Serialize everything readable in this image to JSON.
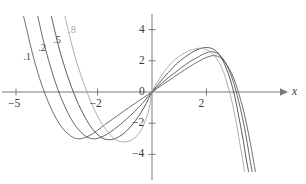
{
  "chart_data": {
    "type": "line",
    "title": "",
    "subtitle": "",
    "xlabel": "x",
    "ylabel": "",
    "xlim": [
      -5.7,
      5.7
    ],
    "ylim": [
      -5.0,
      4.8
    ],
    "grid": false,
    "legend_position": "inline-curve-labels",
    "x_ticks": [
      -5,
      -2,
      2
    ],
    "x_tick_labels": [
      "−5",
      "−2",
      "2"
    ],
    "y_ticks": [
      4,
      2,
      0,
      -2,
      -4
    ],
    "y_tick_labels": [
      "4",
      "2",
      "0",
      "−2",
      "−4"
    ],
    "annotations": [
      {
        "text": ".1",
        "x": -4.55,
        "y": 2.15,
        "color": "#4a4a4a"
      },
      {
        "text": ".2",
        "x": -4.0,
        "y": 2.75,
        "color": "#4a4a4a"
      },
      {
        "text": ".5",
        "x": -3.45,
        "y": 3.3,
        "color": "#4a4a4a"
      },
      {
        "text": ".8",
        "x": -2.9,
        "y": 3.9,
        "color": "#a8a8a8"
      }
    ],
    "series": [
      {
        "name": ".1",
        "color": "#555555",
        "points": [
          [
            -4.72,
            4.85
          ],
          [
            -4.55,
            3.6
          ],
          [
            -4.4,
            2.5
          ],
          [
            -4.2,
            1.25
          ],
          [
            -4.0,
            0.2
          ],
          [
            -3.8,
            -0.7
          ],
          [
            -3.6,
            -1.45
          ],
          [
            -3.4,
            -2.05
          ],
          [
            -3.2,
            -2.5
          ],
          [
            -3.0,
            -2.8
          ],
          [
            -2.85,
            -2.95
          ],
          [
            -2.7,
            -3.0
          ],
          [
            -2.55,
            -2.97
          ],
          [
            -2.4,
            -2.88
          ],
          [
            -2.2,
            -2.7
          ],
          [
            -2.0,
            -2.45
          ],
          [
            -1.7,
            -2.05
          ],
          [
            -1.4,
            -1.68
          ],
          [
            -1.0,
            -1.18
          ],
          [
            -0.6,
            -0.7
          ],
          [
            -0.3,
            -0.35
          ],
          [
            0,
            0
          ],
          [
            0.4,
            0.48
          ],
          [
            0.8,
            0.95
          ],
          [
            1.2,
            1.42
          ],
          [
            1.5,
            1.75
          ],
          [
            1.75,
            2.0
          ],
          [
            1.95,
            2.18
          ],
          [
            2.1,
            2.28
          ],
          [
            2.25,
            2.33
          ],
          [
            2.4,
            2.3
          ],
          [
            2.55,
            2.15
          ],
          [
            2.7,
            1.88
          ],
          [
            2.85,
            1.45
          ],
          [
            3.0,
            0.9
          ],
          [
            3.12,
            0.3
          ],
          [
            3.25,
            -0.45
          ],
          [
            3.38,
            -1.3
          ],
          [
            3.5,
            -2.25
          ],
          [
            3.62,
            -3.3
          ],
          [
            3.72,
            -4.3
          ],
          [
            3.8,
            -5.1
          ]
        ]
      },
      {
        "name": ".2",
        "color": "#4a4a4a",
        "points": [
          [
            -4.2,
            4.85
          ],
          [
            -4.05,
            3.7
          ],
          [
            -3.9,
            2.65
          ],
          [
            -3.72,
            1.55
          ],
          [
            -3.55,
            0.6
          ],
          [
            -3.38,
            -0.2
          ],
          [
            -3.2,
            -0.95
          ],
          [
            -3.0,
            -1.65
          ],
          [
            -2.8,
            -2.2
          ],
          [
            -2.6,
            -2.6
          ],
          [
            -2.45,
            -2.82
          ],
          [
            -2.3,
            -2.95
          ],
          [
            -2.15,
            -3.0
          ],
          [
            -2.0,
            -2.97
          ],
          [
            -1.85,
            -2.88
          ],
          [
            -1.65,
            -2.7
          ],
          [
            -1.4,
            -2.4
          ],
          [
            -1.1,
            -1.98
          ],
          [
            -0.8,
            -1.52
          ],
          [
            -0.5,
            -1.0
          ],
          [
            -0.25,
            -0.52
          ],
          [
            0,
            0
          ],
          [
            0.35,
            0.55
          ],
          [
            0.7,
            1.05
          ],
          [
            1.05,
            1.52
          ],
          [
            1.4,
            1.95
          ],
          [
            1.65,
            2.2
          ],
          [
            1.85,
            2.4
          ],
          [
            2.0,
            2.52
          ],
          [
            2.15,
            2.58
          ],
          [
            2.3,
            2.55
          ],
          [
            2.45,
            2.42
          ],
          [
            2.6,
            2.15
          ],
          [
            2.75,
            1.72
          ],
          [
            2.88,
            1.2
          ],
          [
            3.0,
            0.6
          ],
          [
            3.12,
            -0.15
          ],
          [
            3.25,
            -1.05
          ],
          [
            3.38,
            -2.1
          ],
          [
            3.5,
            -3.25
          ],
          [
            3.6,
            -4.3
          ],
          [
            3.68,
            -5.1
          ]
        ]
      },
      {
        "name": ".5",
        "color": "#3f3f3f",
        "points": [
          [
            -3.7,
            4.85
          ],
          [
            -3.55,
            3.75
          ],
          [
            -3.4,
            2.7
          ],
          [
            -3.22,
            1.65
          ],
          [
            -3.05,
            0.75
          ],
          [
            -2.88,
            -0.05
          ],
          [
            -2.7,
            -0.8
          ],
          [
            -2.5,
            -1.5
          ],
          [
            -2.3,
            -2.1
          ],
          [
            -2.1,
            -2.55
          ],
          [
            -1.95,
            -2.8
          ],
          [
            -1.8,
            -2.98
          ],
          [
            -1.65,
            -3.05
          ],
          [
            -1.5,
            -3.05
          ],
          [
            -1.35,
            -2.98
          ],
          [
            -1.2,
            -2.85
          ],
          [
            -1.0,
            -2.6
          ],
          [
            -0.8,
            -2.25
          ],
          [
            -0.6,
            -1.82
          ],
          [
            -0.4,
            -1.3
          ],
          [
            -0.2,
            -0.7
          ],
          [
            0,
            0
          ],
          [
            0.3,
            0.65
          ],
          [
            0.6,
            1.25
          ],
          [
            0.9,
            1.8
          ],
          [
            1.2,
            2.22
          ],
          [
            1.45,
            2.52
          ],
          [
            1.65,
            2.7
          ],
          [
            1.85,
            2.82
          ],
          [
            2.0,
            2.85
          ],
          [
            2.15,
            2.82
          ],
          [
            2.3,
            2.7
          ],
          [
            2.45,
            2.45
          ],
          [
            2.6,
            2.05
          ],
          [
            2.72,
            1.55
          ],
          [
            2.85,
            0.95
          ],
          [
            2.98,
            0.15
          ],
          [
            3.1,
            -0.75
          ],
          [
            3.22,
            -1.85
          ],
          [
            3.35,
            -3.05
          ],
          [
            3.45,
            -4.15
          ],
          [
            3.55,
            -5.1
          ]
        ]
      },
      {
        "name": ".8",
        "color": "#a0a0a0",
        "points": [
          [
            -3.2,
            4.85
          ],
          [
            -3.05,
            3.75
          ],
          [
            -2.9,
            2.7
          ],
          [
            -2.72,
            1.65
          ],
          [
            -2.55,
            0.75
          ],
          [
            -2.38,
            -0.05
          ],
          [
            -2.2,
            -0.82
          ],
          [
            -2.0,
            -1.55
          ],
          [
            -1.8,
            -2.15
          ],
          [
            -1.6,
            -2.62
          ],
          [
            -1.45,
            -2.9
          ],
          [
            -1.3,
            -3.08
          ],
          [
            -1.15,
            -3.18
          ],
          [
            -1.0,
            -3.2
          ],
          [
            -0.85,
            -3.15
          ],
          [
            -0.7,
            -3.02
          ],
          [
            -0.55,
            -2.8
          ],
          [
            -0.4,
            -2.45
          ],
          [
            -0.28,
            -2.0
          ],
          [
            -0.15,
            -1.35
          ],
          [
            -0.07,
            -0.75
          ],
          [
            0,
            0
          ],
          [
            0.25,
            0.78
          ],
          [
            0.5,
            1.42
          ],
          [
            0.8,
            2.0
          ],
          [
            1.05,
            2.35
          ],
          [
            1.3,
            2.6
          ],
          [
            1.5,
            2.72
          ],
          [
            1.7,
            2.8
          ],
          [
            1.85,
            2.8
          ],
          [
            2.0,
            2.72
          ],
          [
            2.15,
            2.58
          ],
          [
            2.3,
            2.32
          ],
          [
            2.45,
            1.95
          ],
          [
            2.58,
            1.5
          ],
          [
            2.7,
            0.92
          ],
          [
            2.82,
            0.2
          ],
          [
            2.95,
            -0.7
          ],
          [
            3.08,
            -1.8
          ],
          [
            3.2,
            -3.0
          ],
          [
            3.32,
            -4.2
          ],
          [
            3.4,
            -5.1
          ]
        ]
      }
    ]
  },
  "axes": {
    "x_axis_name": "x",
    "axis_color": "#7a7a7a",
    "tick_color": "#7a7a7a"
  }
}
